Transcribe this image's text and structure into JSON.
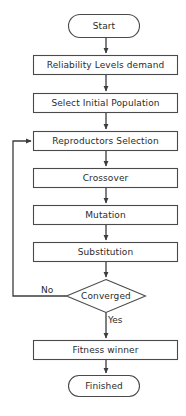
{
  "diagram": {
    "stroke_color": "#4a4a4a",
    "fill_color": "#ffffff",
    "text_color": "#2b2b2b",
    "background": "#ffffff"
  },
  "nodes": [
    {
      "id": "start",
      "shape": "terminator",
      "label": "Start",
      "x": 68,
      "y": 14,
      "w": 72,
      "h": 24
    },
    {
      "id": "reliability",
      "shape": "process",
      "label": "Reliability Levels demand",
      "x": 33,
      "y": 55,
      "w": 145,
      "h": 20
    },
    {
      "id": "population",
      "shape": "process",
      "label": "Select Initial Population",
      "x": 33,
      "y": 93,
      "w": 145,
      "h": 20
    },
    {
      "id": "reproductors",
      "shape": "process",
      "label": "Reproductors Selection",
      "x": 33,
      "y": 131,
      "w": 145,
      "h": 20
    },
    {
      "id": "crossover",
      "shape": "process",
      "label": "Crossover",
      "x": 33,
      "y": 168,
      "w": 145,
      "h": 20
    },
    {
      "id": "mutation",
      "shape": "process",
      "label": "Mutation",
      "x": 33,
      "y": 205,
      "w": 145,
      "h": 20
    },
    {
      "id": "substitution",
      "shape": "process",
      "label": "Substitution",
      "x": 33,
      "y": 242,
      "w": 145,
      "h": 20
    },
    {
      "id": "converged",
      "shape": "decision",
      "label": "Converged",
      "x": 66,
      "y": 279,
      "w": 80,
      "h": 34
    },
    {
      "id": "fitness",
      "shape": "process",
      "label": "Fitness winner",
      "x": 33,
      "y": 340,
      "w": 145,
      "h": 20
    },
    {
      "id": "finished",
      "shape": "terminator",
      "label": "Finished",
      "x": 68,
      "y": 375,
      "w": 72,
      "h": 22
    }
  ],
  "edges": [
    {
      "id": "e-start-reliability",
      "from": "start",
      "to": "reliability",
      "label": ""
    },
    {
      "id": "e-reliability-population",
      "from": "reliability",
      "to": "population",
      "label": ""
    },
    {
      "id": "e-population-reproductors",
      "from": "population",
      "to": "reproductors",
      "label": ""
    },
    {
      "id": "e-reproductors-crossover",
      "from": "reproductors",
      "to": "crossover",
      "label": ""
    },
    {
      "id": "e-crossover-mutation",
      "from": "crossover",
      "to": "mutation",
      "label": ""
    },
    {
      "id": "e-mutation-substitution",
      "from": "mutation",
      "to": "substitution",
      "label": ""
    },
    {
      "id": "e-substitution-converged",
      "from": "substitution",
      "to": "converged",
      "label": ""
    },
    {
      "id": "e-converged-reproductors-no",
      "from": "converged",
      "to": "reproductors",
      "label": "No"
    },
    {
      "id": "e-converged-fitness-yes",
      "from": "converged",
      "to": "fitness",
      "label": "Yes"
    },
    {
      "id": "e-fitness-finished",
      "from": "fitness",
      "to": "finished",
      "label": ""
    }
  ],
  "edge_labels": {
    "no": {
      "text": "No",
      "x": 41,
      "y": 285
    },
    "yes": {
      "text": "Yes",
      "x": 108,
      "y": 316
    }
  }
}
